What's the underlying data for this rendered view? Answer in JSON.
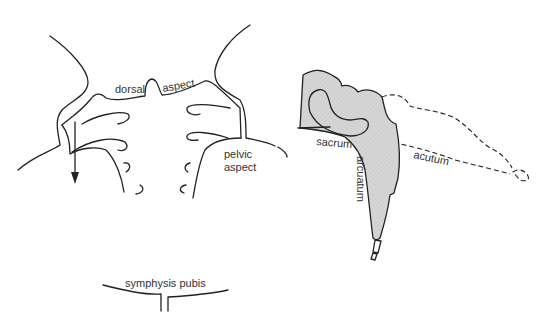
{
  "left_view": {
    "labels": {
      "dorsal": "dorsal",
      "aspect_top": "aspect",
      "pelvic": "pelvic",
      "aspect_bottom": "aspect",
      "symphysis": "symphysis pubis"
    }
  },
  "right_view": {
    "labels": {
      "sacrum": "sacrum",
      "arcuatum": "arcuatum",
      "acutum": "acutum"
    },
    "fill_color": "#d4d4d4"
  }
}
